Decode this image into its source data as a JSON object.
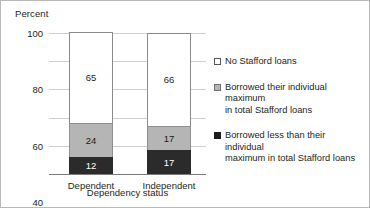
{
  "chart_data": {
    "type": "bar",
    "subtype": "stacked-bar",
    "title": "",
    "ylabel": "Percent",
    "xlabel": "Dependency status",
    "categories": [
      "Dependent",
      "Independent"
    ],
    "ylim": [
      0,
      100
    ],
    "yticks": [
      "0",
      "20",
      "40",
      "60",
      "80",
      "100"
    ],
    "ytick_values": [
      0,
      20,
      40,
      60,
      80,
      100
    ],
    "grid": true,
    "legend_position": "right",
    "stack_order_bottom_to_top": [
      "Borrowed less than their individual maximum in total Stafford loans",
      "Borrowed their individual maximum in total Stafford loans",
      "No Stafford loans"
    ],
    "series": [
      {
        "name": "Borrowed less than their individual maximum in total Stafford loans",
        "legend_label_lines": [
          "Borrowed less than their individual",
          "maximum in total Stafford loans"
        ],
        "color": "#2b2b2b",
        "swatch": "sw-dark",
        "values": [
          12,
          17
        ],
        "labels": [
          "12",
          "17"
        ]
      },
      {
        "name": "Borrowed their individual maximum in total Stafford loans",
        "legend_label_lines": [
          "Borrowed their individual maximum",
          "in total Stafford loans"
        ],
        "color": "#b5b5b5",
        "swatch": "sw-gray",
        "values": [
          24,
          17
        ],
        "labels": [
          "24",
          "17"
        ]
      },
      {
        "name": "No Stafford loans",
        "legend_label_lines": [
          "No Stafford loans"
        ],
        "color": "#ffffff",
        "swatch": "sw-white",
        "values": [
          65,
          66
        ],
        "labels": [
          "65",
          "66"
        ]
      }
    ]
  },
  "axis": {
    "ylabel": "Percent",
    "xlabel": "Dependency status",
    "yticks": [
      "100",
      "80",
      "60",
      "40",
      "20",
      "0"
    ],
    "xticks": [
      "Dependent",
      "Independent"
    ]
  },
  "legend": {
    "items": [
      {
        "swatch": "sw-white",
        "line1": "No Stafford loans",
        "line2": ""
      },
      {
        "swatch": "sw-gray",
        "line1": "Borrowed their individual maximum",
        "line2": "in total Stafford loans"
      },
      {
        "swatch": "sw-dark",
        "line1": "Borrowed less than their individual",
        "line2": "maximum in total Stafford loans"
      }
    ]
  },
  "bars": [
    {
      "category": "Dependent",
      "segments": [
        {
          "cls": "seg-dark",
          "value": 12,
          "label": "12"
        },
        {
          "cls": "seg-gray",
          "value": 24,
          "label": "24"
        },
        {
          "cls": "seg-white",
          "value": 65,
          "label": "65"
        }
      ]
    },
    {
      "category": "Independent",
      "segments": [
        {
          "cls": "seg-dark",
          "value": 17,
          "label": "17"
        },
        {
          "cls": "seg-gray",
          "value": 17,
          "label": "17"
        },
        {
          "cls": "seg-white",
          "value": 66,
          "label": "66"
        }
      ]
    }
  ]
}
